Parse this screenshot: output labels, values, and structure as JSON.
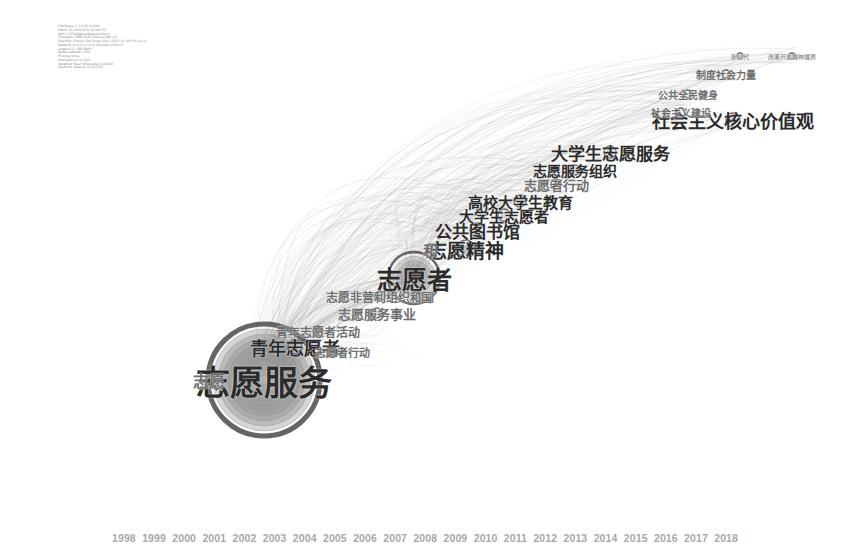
{
  "header": {
    "lines": [
      "CiteSpace, v. 5.5.R2 (64-bit)",
      "March 12, 2019 9:41:22 AM CST",
      "WoS: C:\\CiteSpace\\data\\volunteer\\",
      "Timespan: 1998-2018 (Slice Length=1)",
      "Selection Criteria: Top 50 per slice, LRF=3.0, LBY=8, e=2.0",
      "Network: N=212, E=476 (Density=0.0213)",
      "Largest CC: 188 (88%)",
      "Nodes Labeled: 1.0%",
      "Pruning: None",
      "Modularity Q=0.6312",
      "Weighted Mean Silhouette S=0.8457",
      "Harmonic Mean(Q, S)=0.7231"
    ]
  },
  "chart_data": {
    "type": "network",
    "legend_position": "bottom",
    "timeline": {
      "label": "Year slices",
      "years": [
        "1998",
        "1999",
        "2000",
        "2001",
        "2002",
        "2003",
        "2004",
        "2005",
        "2006",
        "2007",
        "2008",
        "2009",
        "2010",
        "2011",
        "2012",
        "2013",
        "2014",
        "2015",
        "2016",
        "2017",
        "2018"
      ],
      "range": [
        1998,
        2018
      ]
    },
    "colors": {
      "node_ring_dark": "#4a4a4a",
      "node_ring_mid": "#8a8a8a",
      "node_fill": "#c9c9c9",
      "link": "#9b9b9b",
      "label_dark": "#2b2b2b",
      "label_faint": "#6e6e6e",
      "label_ghost": "#9a9a9a",
      "timeline_text": "#a8a8a8",
      "background": "#ffffff"
    },
    "nodes": [
      {
        "id": "n1",
        "label": "志愿服务",
        "x": 264,
        "y": 380,
        "r": 56,
        "rings": 11,
        "font": 34,
        "weight": "major",
        "freq": 415
      },
      {
        "id": "n2",
        "label": "志愿者",
        "x": 414,
        "y": 278,
        "r": 26,
        "rings": 6,
        "font": 25,
        "weight": "major",
        "freq": 188
      },
      {
        "id": "n3",
        "label": "志愿精神",
        "x": 466,
        "y": 249,
        "r": 9,
        "rings": 3,
        "font": 19,
        "weight": "mid",
        "freq": 64
      },
      {
        "id": "n4",
        "label": "公共图书馆",
        "x": 477,
        "y": 230,
        "r": 7,
        "rings": 2,
        "font": 17,
        "weight": "mid",
        "freq": 52
      },
      {
        "id": "n5",
        "label": "大学生志愿者",
        "x": 504,
        "y": 215,
        "r": 6,
        "rings": 2,
        "font": 15,
        "weight": "mid",
        "freq": 46
      },
      {
        "id": "n6",
        "label": "高校大学生教育",
        "x": 520,
        "y": 201,
        "r": 6,
        "rings": 2,
        "font": 15,
        "weight": "mid",
        "freq": 44
      },
      {
        "id": "n7",
        "label": "志愿者行动",
        "x": 556,
        "y": 184,
        "r": 5,
        "rings": 2,
        "font": 13,
        "weight": "small",
        "freq": 31
      },
      {
        "id": "n8",
        "label": "志愿服务组织",
        "x": 575,
        "y": 170,
        "r": 5,
        "rings": 2,
        "font": 14,
        "weight": "mid",
        "freq": 38
      },
      {
        "id": "n9",
        "label": "大学生志愿服务",
        "x": 610,
        "y": 152,
        "r": 6,
        "rings": 2,
        "font": 17,
        "weight": "mid",
        "freq": 55
      },
      {
        "id": "n10",
        "label": "社会主义核心价值观",
        "x": 733,
        "y": 120,
        "r": 7,
        "rings": 2,
        "font": 18,
        "weight": "major",
        "freq": 72
      },
      {
        "id": "n11",
        "label": "社会主义建设",
        "x": 681,
        "y": 112,
        "r": 4,
        "rings": 1,
        "font": 10,
        "weight": "small",
        "freq": 19
      },
      {
        "id": "n12",
        "label": "公共全民健身",
        "x": 688,
        "y": 94,
        "r": 4,
        "rings": 1,
        "font": 10,
        "weight": "small",
        "freq": 17
      },
      {
        "id": "n13",
        "label": "制度社会力量",
        "x": 726,
        "y": 74,
        "r": 4,
        "rings": 1,
        "font": 10,
        "weight": "small",
        "freq": 16
      },
      {
        "id": "n14",
        "label": "新时代",
        "x": 740,
        "y": 56,
        "r": 3,
        "rings": 1,
        "font": 6,
        "weight": "tiny",
        "freq": 9
      },
      {
        "id": "n15",
        "label": "改革开放精神境界",
        "x": 792,
        "y": 56,
        "r": 3,
        "rings": 1,
        "font": 6,
        "weight": "tiny",
        "freq": 8
      },
      {
        "id": "n16",
        "label": "志愿服务事业",
        "x": 377,
        "y": 313,
        "r": 5,
        "rings": 2,
        "font": 13,
        "weight": "small",
        "freq": 29
      },
      {
        "id": "n17",
        "label": "志愿非营利组织和国",
        "x": 380,
        "y": 296,
        "r": 5,
        "rings": 2,
        "font": 12,
        "weight": "small",
        "freq": 27
      },
      {
        "id": "n18",
        "label": "青年志愿者活动",
        "x": 318,
        "y": 331,
        "r": 5,
        "rings": 2,
        "font": 12,
        "weight": "small",
        "freq": 26
      },
      {
        "id": "n19",
        "label": "青年志愿者",
        "x": 295,
        "y": 347,
        "r": 7,
        "rings": 2,
        "font": 18,
        "weight": "mid",
        "freq": 58
      },
      {
        "id": "n20",
        "label": "志愿者行动",
        "x": 342,
        "y": 352,
        "r": 4,
        "rings": 1,
        "font": 11,
        "weight": "small",
        "freq": 21
      },
      {
        "id": "n21",
        "label": "志愿",
        "x": 209,
        "y": 380,
        "r": 4,
        "rings": 1,
        "font": 16,
        "weight": "small",
        "freq": 24
      },
      {
        "id": "n22",
        "label": "和",
        "x": 430,
        "y": 249,
        "r": 3,
        "rings": 1,
        "font": 15,
        "weight": "small",
        "freq": 12
      },
      {
        "id": "n23",
        "label": "和国",
        "x": 421,
        "y": 297,
        "r": 3,
        "rings": 1,
        "font": 11,
        "weight": "small",
        "freq": 11
      }
    ],
    "link_count": 476,
    "node_count": 212
  }
}
